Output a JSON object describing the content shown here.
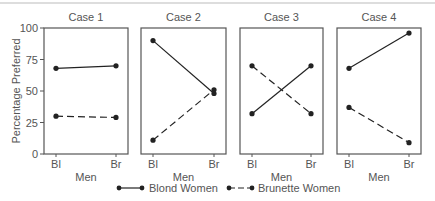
{
  "chart_data": {
    "type": "line",
    "title": "",
    "ylabel": "Percentage Preferred",
    "xlabel": "Men",
    "ylim": [
      0,
      100
    ],
    "yticks": [
      0,
      25,
      50,
      75,
      100
    ],
    "categories": [
      "Bl",
      "Br"
    ],
    "legend": [
      {
        "name": "Blond Women",
        "style": "solid"
      },
      {
        "name": "Brunette Women",
        "style": "dashed"
      }
    ],
    "panels": [
      {
        "title": "Case 1",
        "series": [
          {
            "name": "Blond Women",
            "values": [
              68,
              70
            ]
          },
          {
            "name": "Brunette Women",
            "values": [
              30,
              29
            ]
          }
        ]
      },
      {
        "title": "Case 2",
        "series": [
          {
            "name": "Blond Women",
            "values": [
              90,
              48
            ]
          },
          {
            "name": "Brunette Women",
            "values": [
              11,
              51
            ]
          }
        ]
      },
      {
        "title": "Case 3",
        "series": [
          {
            "name": "Blond Women",
            "values": [
              32,
              70
            ]
          },
          {
            "name": "Brunette Women",
            "values": [
              70,
              32
            ]
          }
        ]
      },
      {
        "title": "Case 4",
        "series": [
          {
            "name": "Blond Women",
            "values": [
              68,
              96
            ]
          },
          {
            "name": "Brunette Women",
            "values": [
              37,
              9
            ]
          }
        ]
      }
    ]
  },
  "colors": {
    "line": "#222222",
    "frame": "#555555",
    "text": "#555555"
  }
}
